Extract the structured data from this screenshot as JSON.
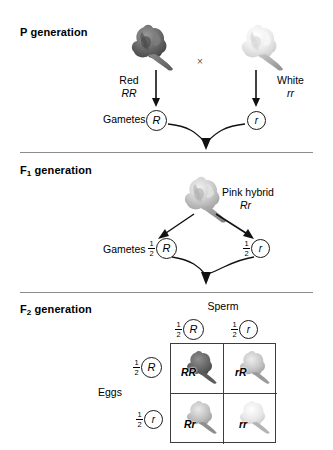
{
  "figure": {
    "cross_symbol": "×"
  },
  "sections": {
    "p": {
      "heading": "P generation",
      "heading_main": "P",
      "heading_rest": " generation",
      "parent_left": {
        "phenotype": "Red",
        "genotype": "RR",
        "flower_color": "#6e6e6e"
      },
      "parent_right": {
        "phenotype": "White",
        "genotype": "rr",
        "flower_color": "#e8e8e8"
      },
      "gametes_label": "Gametes",
      "gamete_left": "R",
      "gamete_right": "r"
    },
    "f1": {
      "heading_main": "F",
      "heading_sub": "1",
      "heading_rest": " generation",
      "offspring": {
        "phenotype": "Pink hybrid",
        "genotype": "Rr",
        "flower_color": "#c4c4c4"
      },
      "gametes_label": "Gametes",
      "gamete_left": {
        "fraction_num": "1",
        "fraction_den": "2",
        "allele": "R"
      },
      "gamete_right": {
        "fraction_num": "1",
        "fraction_den": "2",
        "allele": "r"
      }
    },
    "f2": {
      "heading_main": "F",
      "heading_sub": "2",
      "heading_rest": " generation",
      "sperm_label": "Sperm",
      "eggs_label": "Eggs",
      "sperm_columns": [
        {
          "fraction_num": "1",
          "fraction_den": "2",
          "allele": "R"
        },
        {
          "fraction_num": "1",
          "fraction_den": "2",
          "allele": "r"
        }
      ],
      "egg_rows": [
        {
          "fraction_num": "1",
          "fraction_den": "2",
          "allele": "R"
        },
        {
          "fraction_num": "1",
          "fraction_den": "2",
          "allele": "r"
        }
      ],
      "punnett_cells": [
        {
          "genotype": "RR",
          "phenotype": "red",
          "flower_color": "#6e6e6e"
        },
        {
          "genotype": "rR",
          "phenotype": "pink",
          "flower_color": "#bdbdbd"
        },
        {
          "genotype": "Rr",
          "phenotype": "pink",
          "flower_color": "#b5b5b5"
        },
        {
          "genotype": "rr",
          "phenotype": "white",
          "flower_color": "#e4e4e4"
        }
      ]
    }
  }
}
